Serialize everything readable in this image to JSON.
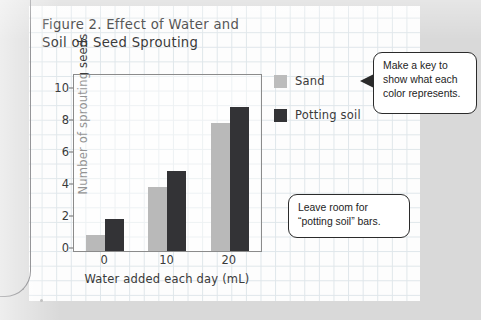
{
  "page": {
    "background_color": "#d9d9d9",
    "paper_color": "#fdfdfd",
    "grid_line_color": "#dfe6ea"
  },
  "figure": {
    "title_line1": "Figure 2. Effect of Water and",
    "title_line2": "Soil on Seed Sprouting"
  },
  "legend": {
    "items": [
      {
        "label": "Sand",
        "color": "#bcbcbc",
        "swatch_name": "legend-swatch-sand"
      },
      {
        "label": "Potting soil",
        "color": "#333336",
        "swatch_name": "legend-swatch-potting-soil"
      }
    ]
  },
  "callouts": [
    {
      "id": "key",
      "line1": "Make a key to",
      "line2": "show what each",
      "line3": "color represents.",
      "pointer": "left-triangle"
    },
    {
      "id": "room",
      "line1": "Leave room for",
      "line2": "“potting soil” bars.",
      "line3": "",
      "pointer": "none"
    }
  ],
  "chart_data": {
    "type": "bar",
    "title": "Figure 2. Effect of Water and Soil on Seed Sprouting",
    "xlabel": "Water added each day (mL)",
    "ylabel": "Number of sprouting seeds",
    "categories": [
      "0",
      "10",
      "20"
    ],
    "series": [
      {
        "name": "Sand",
        "color": "#b9b9b9",
        "values": [
          1,
          4,
          8
        ]
      },
      {
        "name": "Potting soil",
        "color": "#333336",
        "values": [
          2,
          5,
          9
        ]
      }
    ],
    "yticks": [
      0,
      2,
      4,
      6,
      8,
      10
    ],
    "ylim": [
      0,
      11
    ],
    "grid": false,
    "legend_position": "right"
  }
}
